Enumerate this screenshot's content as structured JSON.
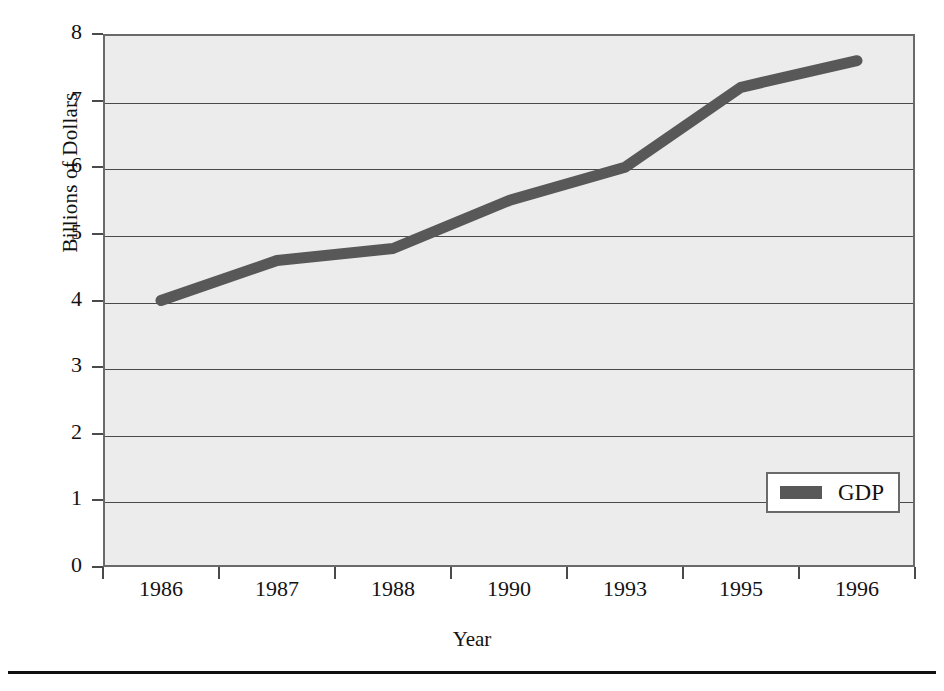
{
  "chart_data": {
    "type": "line",
    "title": "",
    "xlabel": "Year",
    "ylabel": "Billions of Dollars",
    "categories": [
      "1986",
      "1987",
      "1988",
      "1990",
      "1993",
      "1995",
      "1996"
    ],
    "series": [
      {
        "name": "GDP",
        "color": "#585858",
        "values": [
          4.0,
          4.6,
          4.78,
          5.5,
          6.0,
          7.2,
          7.6
        ]
      }
    ],
    "ylim": [
      0,
      8
    ],
    "yticks": [
      0,
      1,
      2,
      3,
      4,
      5,
      6,
      7,
      8
    ],
    "ytick_labels": [
      "0",
      "1",
      "2",
      "3",
      "4",
      "5",
      "6",
      "7",
      "8"
    ],
    "grid": true,
    "grid_axis": "y",
    "legend": {
      "position": "lower-right",
      "entries": [
        "GDP"
      ]
    },
    "plot_background": "#ececec",
    "frame_color": "#6a6a6a"
  },
  "axes": {
    "y_title": "Billions of Dollars",
    "x_title": "Year"
  },
  "legend": {
    "gdp_label": "GDP"
  }
}
